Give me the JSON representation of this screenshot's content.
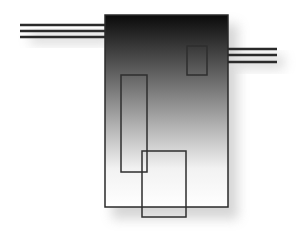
{
  "diagram": {
    "canvas": {
      "width": 298,
      "height": 237,
      "background": "#ffffff"
    },
    "main_body": {
      "x": 105,
      "y": 15,
      "w": 123,
      "h": 192,
      "gradient_top": "#0a0a0a",
      "gradient_mid": "#9a9a9a",
      "gradient_bottom": "#ffffff",
      "stroke": "#2a2a2a"
    },
    "left_pins": {
      "x1": 20,
      "x2": 105,
      "ys": [
        25,
        31,
        37
      ],
      "color": "#2a2a2a"
    },
    "right_pins": {
      "x1": 228,
      "x2": 277,
      "ys": [
        49,
        55,
        62
      ],
      "color": "#2a2a2a"
    },
    "small_rect": {
      "x": 187,
      "y": 46,
      "w": 20,
      "h": 29
    },
    "tall_rect": {
      "x": 121,
      "y": 75,
      "w": 26,
      "h": 97
    },
    "lower_rect": {
      "x": 142,
      "y": 151,
      "w": 44,
      "h": 66
    }
  }
}
